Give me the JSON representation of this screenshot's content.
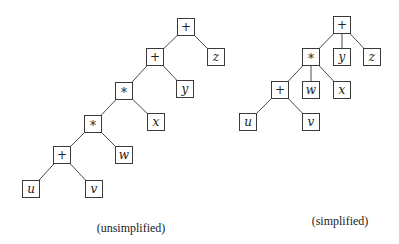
{
  "diagrams": [
    {
      "id": "unsimplified",
      "caption": "(unsimplified)",
      "caption_pos": {
        "x": 131,
        "y": 221
      },
      "nodes": [
        {
          "id": "n1",
          "label": "+",
          "kind": "op",
          "x": 186,
          "y": 27
        },
        {
          "id": "n2",
          "label": "z",
          "kind": "var",
          "x": 216,
          "y": 57
        },
        {
          "id": "n3",
          "label": "+",
          "kind": "op",
          "x": 155,
          "y": 57
        },
        {
          "id": "n4",
          "label": "y",
          "kind": "var",
          "x": 185,
          "y": 89
        },
        {
          "id": "n5",
          "label": "*",
          "kind": "op",
          "x": 124,
          "y": 91
        },
        {
          "id": "n6",
          "label": "x",
          "kind": "var",
          "x": 156,
          "y": 122
        },
        {
          "id": "n7",
          "label": "*",
          "kind": "op",
          "x": 93,
          "y": 124
        },
        {
          "id": "n8",
          "label": "w",
          "kind": "var",
          "x": 124,
          "y": 155
        },
        {
          "id": "n9",
          "label": "+",
          "kind": "op",
          "x": 62,
          "y": 155
        },
        {
          "id": "n10",
          "label": "v",
          "kind": "var",
          "x": 94,
          "y": 189
        },
        {
          "id": "n11",
          "label": "u",
          "kind": "var",
          "x": 31,
          "y": 189
        }
      ],
      "edges": [
        [
          "n1",
          "n3"
        ],
        [
          "n1",
          "n2"
        ],
        [
          "n3",
          "n5"
        ],
        [
          "n3",
          "n4"
        ],
        [
          "n5",
          "n7"
        ],
        [
          "n5",
          "n6"
        ],
        [
          "n7",
          "n9"
        ],
        [
          "n7",
          "n8"
        ],
        [
          "n9",
          "n11"
        ],
        [
          "n9",
          "n10"
        ]
      ]
    },
    {
      "id": "simplified",
      "caption": "(simplified)",
      "caption_pos": {
        "x": 340,
        "y": 214
      },
      "nodes": [
        {
          "id": "s1",
          "label": "+",
          "kind": "op",
          "x": 342,
          "y": 25
        },
        {
          "id": "s2",
          "label": "*",
          "kind": "op",
          "x": 311,
          "y": 57
        },
        {
          "id": "s3",
          "label": "y",
          "kind": "var",
          "x": 342,
          "y": 57
        },
        {
          "id": "s4",
          "label": "z",
          "kind": "var",
          "x": 372,
          "y": 57
        },
        {
          "id": "s5",
          "label": "+",
          "kind": "op",
          "x": 280,
          "y": 90
        },
        {
          "id": "s6",
          "label": "w",
          "kind": "var",
          "x": 311,
          "y": 90
        },
        {
          "id": "s7",
          "label": "x",
          "kind": "var",
          "x": 342,
          "y": 90
        },
        {
          "id": "s8",
          "label": "u",
          "kind": "var",
          "x": 248,
          "y": 122
        },
        {
          "id": "s9",
          "label": "v",
          "kind": "var",
          "x": 311,
          "y": 122
        }
      ],
      "edges": [
        [
          "s1",
          "s2"
        ],
        [
          "s1",
          "s3"
        ],
        [
          "s1",
          "s4"
        ],
        [
          "s2",
          "s5"
        ],
        [
          "s2",
          "s6"
        ],
        [
          "s2",
          "s7"
        ],
        [
          "s5",
          "s8"
        ],
        [
          "s5",
          "s9"
        ]
      ]
    }
  ],
  "style": {
    "box_size": 17,
    "stroke": "#3a3a3a",
    "background": "#ffffff"
  }
}
